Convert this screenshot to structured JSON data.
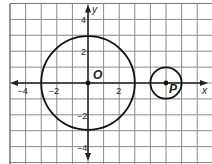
{
  "figure": {
    "type": "coordinate-plane",
    "axes": {
      "x_label": "x",
      "y_label": "y",
      "x_ticks": [
        {
          "value": -4,
          "label": "−4"
        },
        {
          "value": -2,
          "label": "−2"
        },
        {
          "value": 2,
          "label": "2"
        }
      ],
      "y_ticks": [
        {
          "value": 4,
          "label": "4"
        },
        {
          "value": 2,
          "label": "2"
        },
        {
          "value": -2,
          "label": "−2"
        },
        {
          "value": -4,
          "label": "−4"
        }
      ],
      "x_range": [
        -5,
        8
      ],
      "y_range": [
        -5,
        5
      ]
    },
    "points": [
      {
        "name": "O",
        "label": "O",
        "x": 0,
        "y": 0
      },
      {
        "name": "P",
        "label": "P",
        "x": 5,
        "y": 0
      }
    ],
    "circles": [
      {
        "center": "O",
        "cx": 0,
        "cy": 0,
        "r": 3
      },
      {
        "center": "P",
        "cx": 5,
        "cy": 0,
        "r": 1
      }
    ],
    "colors": {
      "grid": "#8a8a8a",
      "axis": "#222222",
      "circle": "#111111",
      "background": "#ffffff"
    }
  }
}
